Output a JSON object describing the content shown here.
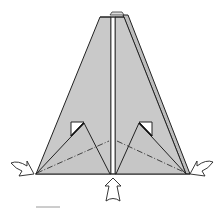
{
  "diagram": {
    "colors": {
      "paper_fill": "#c9c9c9",
      "paper_fill_light": "#d2d2d2",
      "line": "#222222",
      "arrow_fill": "#ffffff",
      "background": "#ffffff",
      "scale_bar": "#9a9a9a"
    },
    "elements": {
      "main_shape": "trapezoid-pyramid",
      "center_crease": "double vertical line",
      "inner_flaps": [
        "left triangular flap",
        "right triangular flap"
      ],
      "white_pockets": [
        "left pocket",
        "right pocket"
      ],
      "fold_lines": [
        "left mountain fold (dash-dot)",
        "right mountain fold (dash-dot)"
      ],
      "arrows": [
        "push-in-left",
        "push-in-right",
        "push-up-bottom"
      ]
    }
  }
}
